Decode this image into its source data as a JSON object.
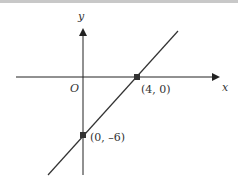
{
  "diagram": {
    "axes": {
      "x_label": "x",
      "y_label": "y",
      "origin_label": "O"
    },
    "points": [
      {
        "label": "(4, 0)",
        "x": 4,
        "y": 0
      },
      {
        "label": "(0, –6)",
        "x": 0,
        "y": -6
      }
    ],
    "line": {
      "equation_implied": "y = 1.5x - 6"
    },
    "colors": {
      "line": "#333333",
      "axes": "#222222",
      "points": "#333333"
    }
  }
}
